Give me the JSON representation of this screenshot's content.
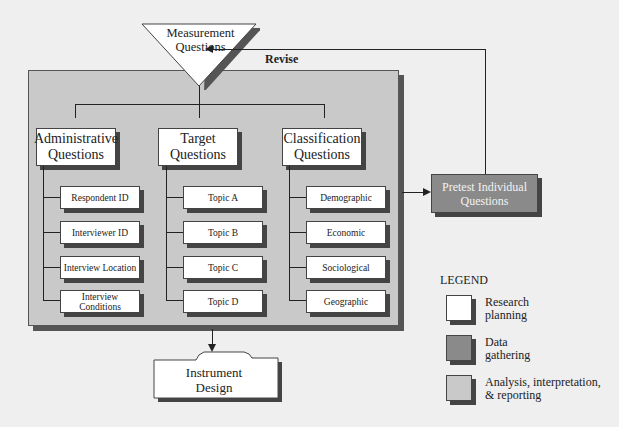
{
  "top": {
    "measurement": "Measurement Questions",
    "revise": "Revise"
  },
  "columns": [
    {
      "title": "Administrative Questions",
      "items": [
        "Respondent ID",
        "Interviewer ID",
        "Interview Location",
        "Interview Conditions"
      ]
    },
    {
      "title": "Target Questions",
      "items": [
        "Topic A",
        "Topic B",
        "Topic C",
        "Topic D"
      ]
    },
    {
      "title": "Classification Questions",
      "items": [
        "Demographic",
        "Economic",
        "Sociological",
        "Geographic"
      ]
    }
  ],
  "pretest": "Pretest Individual Questions",
  "instrument": "Instrument Design",
  "legend": {
    "title": "LEGEND",
    "entries": [
      {
        "label": "Research planning",
        "color": "#ffffff"
      },
      {
        "label": "Data gathering",
        "color": "#8a8a8a"
      },
      {
        "label": "Analysis, interpretation, & reporting",
        "color": "#c9c9c9"
      }
    ]
  }
}
